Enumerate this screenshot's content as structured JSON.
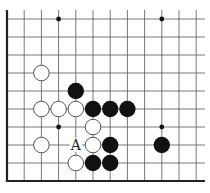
{
  "diagram": {
    "type": "go-board-fragment",
    "edges": [
      "left",
      "bottom"
    ],
    "columns": 12,
    "rows": 10,
    "grid": {
      "x0": 7,
      "y0": 19,
      "col_spacing": 17.2,
      "row_spacing": 18,
      "line_top": 10,
      "line_right": 205,
      "bottom_edge_y": 181,
      "line_color": "#555555",
      "edge_color": "#222222"
    },
    "star_points": [
      {
        "col": 3,
        "row": 0
      },
      {
        "col": 9,
        "row": 0
      },
      {
        "col": 3,
        "row": 6
      },
      {
        "col": 9,
        "row": 6
      }
    ],
    "stones": [
      {
        "color": "white",
        "col": 2,
        "row": 3
      },
      {
        "color": "black",
        "col": 4,
        "row": 4
      },
      {
        "color": "white",
        "col": 2,
        "row": 5
      },
      {
        "color": "white",
        "col": 3,
        "row": 5
      },
      {
        "color": "white",
        "col": 4,
        "row": 5
      },
      {
        "color": "black",
        "col": 5,
        "row": 5
      },
      {
        "color": "black",
        "col": 6,
        "row": 5
      },
      {
        "color": "black",
        "col": 7,
        "row": 5
      },
      {
        "color": "white",
        "col": 5,
        "row": 6
      },
      {
        "color": "white",
        "col": 2,
        "row": 7
      },
      {
        "color": "white",
        "col": 5,
        "row": 7
      },
      {
        "color": "black",
        "col": 6,
        "row": 7
      },
      {
        "color": "black",
        "col": 9,
        "row": 7
      },
      {
        "color": "white",
        "col": 4,
        "row": 8
      },
      {
        "color": "black",
        "col": 5,
        "row": 8
      },
      {
        "color": "black",
        "col": 6,
        "row": 8
      }
    ],
    "labels": [
      {
        "text": "A",
        "col": 4,
        "row": 7
      }
    ],
    "colors": {
      "black_stone": "#111111",
      "white_stone_fill": "#ffffff",
      "white_stone_stroke": "#444444",
      "background": "#ffffff"
    }
  }
}
